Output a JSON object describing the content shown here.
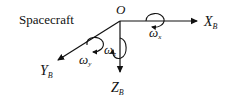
{
  "diagram": {
    "title": "Spacecraft",
    "origin_label": "O",
    "axes": [
      {
        "id": "x",
        "label": "X",
        "subscript": "B",
        "direction": "right"
      },
      {
        "id": "y",
        "label": "Y",
        "subscript": "B",
        "direction": "down-left"
      },
      {
        "id": "z",
        "label": "Z",
        "subscript": "B",
        "direction": "down"
      }
    ],
    "rotations": [
      {
        "id": "wx",
        "symbol": "ω",
        "subscript": "x",
        "axis": "x"
      },
      {
        "id": "wy",
        "symbol": "ω",
        "subscript": "y",
        "axis": "y"
      },
      {
        "id": "wz",
        "symbol": "ω",
        "subscript": "z",
        "axis": "z"
      }
    ],
    "colors": {
      "stroke": "#111111",
      "background": "#ffffff"
    }
  }
}
